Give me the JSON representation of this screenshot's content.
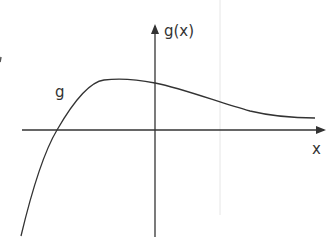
{
  "diagram": {
    "type": "function-graph",
    "function_name": "g",
    "y_axis_label": "g(x)",
    "x_axis_label": "x",
    "curve_label": "g",
    "colors": {
      "axis": "#333333",
      "curve": "#333333",
      "guide_line": "#e6e6e6",
      "background": "#ffffff"
    }
  }
}
